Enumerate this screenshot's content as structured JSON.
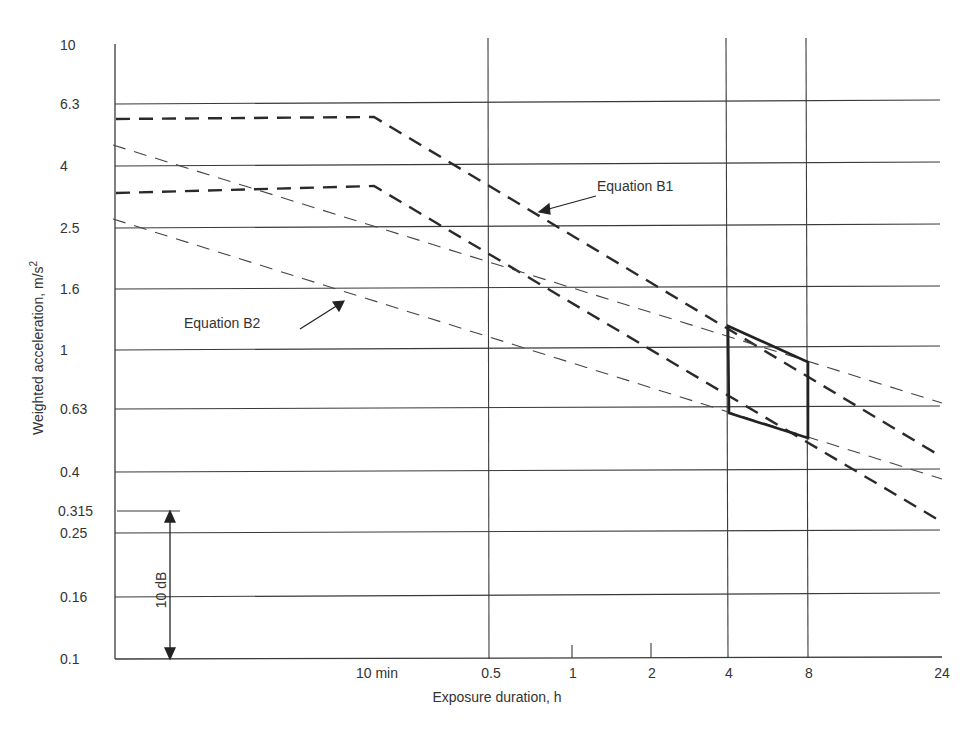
{
  "chart_data": {
    "type": "line",
    "title": "",
    "xlabel": "Exposure duration, h",
    "ylabel": "Weighted acceleration, m/s²",
    "xscale": "log",
    "yscale": "log",
    "ylim": [
      0.1,
      10
    ],
    "xlim_hours": [
      0.02,
      24
    ],
    "grid": true,
    "x_ticks": [
      {
        "label": "10 min",
        "hours": 0.1667
      },
      {
        "label": "0.5",
        "hours": 0.5
      },
      {
        "label": "1",
        "hours": 1
      },
      {
        "label": "2",
        "hours": 2
      },
      {
        "label": "4",
        "hours": 4
      },
      {
        "label": "8",
        "hours": 8
      },
      {
        "label": "24",
        "hours": 24
      }
    ],
    "y_ticks": [
      "10",
      "6.3",
      "4",
      "2.5",
      "1.6",
      "1",
      "0.63",
      "0.4",
      "0.315",
      "0.25",
      "0.16",
      "0.1"
    ],
    "series": [
      {
        "name": "Equation B1 (upper)",
        "style": "thick-dashed",
        "points": [
          [
            0.02,
            6.0
          ],
          [
            0.1667,
            6.0
          ],
          [
            24,
            0.45
          ]
        ]
      },
      {
        "name": "Equation B1 (lower)",
        "style": "thick-dashed",
        "points": [
          [
            0.02,
            3.4
          ],
          [
            0.1667,
            3.6
          ],
          [
            24,
            0.28
          ]
        ]
      },
      {
        "name": "Equation B2 (upper)",
        "style": "thin-dashed",
        "points": [
          [
            0.02,
            4.8
          ],
          [
            24,
            0.63
          ]
        ]
      },
      {
        "name": "Equation B2 (lower)",
        "style": "thin-dashed",
        "points": [
          [
            0.02,
            2.7
          ],
          [
            24,
            0.37
          ]
        ]
      },
      {
        "name": "Health guidance caution zone (4–8 h)",
        "style": "solid-thick",
        "points": [
          [
            4,
            1.25
          ],
          [
            8,
            0.9
          ],
          [
            8,
            0.52
          ],
          [
            4,
            0.6
          ],
          [
            4,
            1.25
          ]
        ]
      }
    ],
    "annotations": [
      {
        "text": "Equation B1",
        "points_to": "Equation B1 (upper)"
      },
      {
        "text": "Equation B2",
        "points_to": "Equation B2 (lower)"
      },
      {
        "text": "10 dB",
        "type": "double-arrow",
        "from": 0.1,
        "to": 0.315
      }
    ]
  },
  "labels": {
    "ylabel": "Weighted acceleration, m/s",
    "ylabel_sup": "2",
    "xlabel": "Exposure duration, h",
    "eq_b1": "Equation B1",
    "eq_b2": "Equation B2",
    "db": "10 dB"
  },
  "yticks": [
    {
      "label": "10",
      "y": 50
    },
    {
      "label": "6.3",
      "y": 109
    },
    {
      "label": "4",
      "y": 171
    },
    {
      "label": "2.5",
      "y": 233
    },
    {
      "label": "1.6",
      "y": 294
    },
    {
      "label": "1",
      "y": 355
    },
    {
      "label": "0.63",
      "y": 414
    },
    {
      "label": "0.4",
      "y": 477
    },
    {
      "label": "0.315",
      "y": 516
    },
    {
      "label": "0.25",
      "y": 538
    },
    {
      "label": "0.16",
      "y": 602
    },
    {
      "label": "0.1",
      "y": 664
    }
  ],
  "xticks": [
    {
      "label": "10 min",
      "x": 377
    },
    {
      "label": "0.5",
      "x": 491
    },
    {
      "label": "1",
      "x": 573
    },
    {
      "label": "2",
      "x": 652
    },
    {
      "label": "4",
      "x": 729
    },
    {
      "label": "8",
      "x": 809
    },
    {
      "label": "24",
      "x": 942
    }
  ]
}
